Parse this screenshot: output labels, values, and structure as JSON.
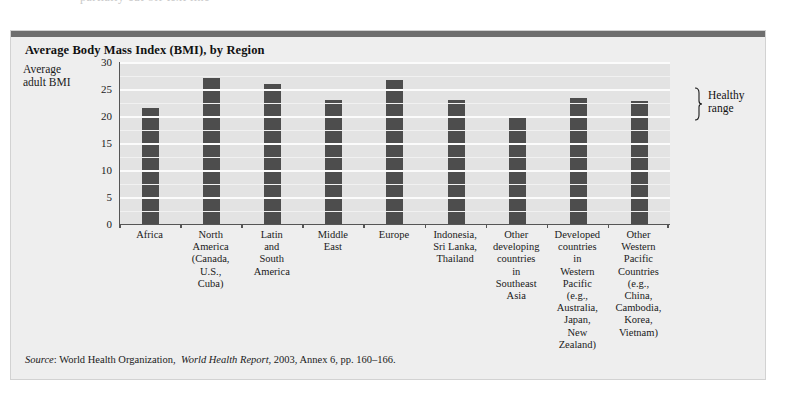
{
  "clipped_header_text": "partially cut off text line",
  "figure": {
    "title": "Average Body Mass Index (BMI), by Region",
    "y_axis_title": "Average\nadult BMI",
    "y_axis_title_line1": "Average",
    "y_axis_title_line2": "adult BMI",
    "annotation": {
      "name": "healthy-range",
      "label_line1": "Healthy",
      "label_line2": "range",
      "bmi_low": 19.5,
      "bmi_high": 25
    },
    "source": {
      "label": "Source",
      "organization": "World Health Organization,",
      "publication": "World Health Report",
      "rest": ", 2003, Annex 6, pp. 160–166."
    },
    "colors": {
      "bar": "#4d4d4d",
      "plot_background": "#e3e3e3",
      "card_background": "#eeeeee",
      "gridline": "#fbfbfb",
      "axis": "#555555",
      "top_rule": "#6e6e6e"
    }
  },
  "chart_data": {
    "type": "bar",
    "title": "Average Body Mass Index (BMI), by Region",
    "xlabel": "",
    "ylabel": "Average adult BMI",
    "ylim": [
      0,
      30
    ],
    "yticks": [
      0,
      5,
      10,
      15,
      20,
      25,
      30
    ],
    "grid": true,
    "legend": "none",
    "categories": [
      "Africa",
      "North America (Canada, U.S., Cuba)",
      "Latin and South America",
      "Middle East",
      "Europe",
      "Indonesia, Sri Lanka, Thailand",
      "Other developing countries in Southeast Asia",
      "Developed countries in Western Pacific (e.g., Australia, Japan, New Zealand)",
      "Other Western Pacific Countries (e.g., China, Cambodia, Korea, Vietnam)"
    ],
    "category_label_lines": [
      [
        "Africa"
      ],
      [
        "North",
        "America",
        "(Canada,",
        "U.S.,",
        "Cuba)"
      ],
      [
        "Latin",
        "and",
        "South",
        "America"
      ],
      [
        "Middle",
        "East"
      ],
      [
        "Europe"
      ],
      [
        "Indonesia,",
        "Sri Lanka,",
        "Thailand"
      ],
      [
        "Other",
        "developing",
        "countries",
        "in",
        "Southeast",
        "Asia"
      ],
      [
        "Developed",
        "countries",
        "in",
        "Western",
        "Pacific",
        "(e.g.,",
        "Australia,",
        "Japan,",
        "New",
        "Zealand)"
      ],
      [
        "Other",
        "Western",
        "Pacific",
        "Countries",
        "(e.g.,",
        "China,",
        "Cambodia,",
        "Korea,",
        "Vietnam)"
      ]
    ],
    "values": [
      21.5,
      27.0,
      26.0,
      23.0,
      26.7,
      23.0,
      20.0,
      23.3,
      22.8
    ],
    "annotations": [
      {
        "text": "Healthy range",
        "type": "bracket",
        "y_from": 19.5,
        "y_to": 25
      }
    ]
  }
}
